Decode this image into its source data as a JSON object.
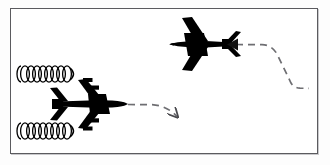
{
  "figure": {
    "domain_label": "wake-turbulence-diagram",
    "background_color": "#ffffff",
    "outer_background_color": "#fdfdfd",
    "frame": {
      "border_color": "#5b5b5f",
      "border_width_px": 1,
      "shadow_color": "#c9c9cc",
      "x": 10,
      "y": 8,
      "width": 308,
      "height": 146
    },
    "ink_color": "#000000",
    "path_color": "#6e6e72",
    "caption": "",
    "title": "",
    "labels": []
  },
  "chart_data": {
    "type": "diagram",
    "title": "",
    "elements": [
      {
        "id": "leading-aircraft",
        "name": "large-aircraft",
        "kind": "aircraft-silhouette",
        "heading": "right",
        "engine_count": 4,
        "center_x": 88,
        "center_y": 104,
        "length_px": 78,
        "wingspan_px": 56,
        "fill": "#000000"
      },
      {
        "id": "following-aircraft",
        "name": "small-aircraft",
        "kind": "aircraft-silhouette",
        "heading": "left",
        "engine_count": 2,
        "center_x": 196,
        "center_y": 44,
        "length_px": 66,
        "wingspan_px": 48,
        "fill": "#000000"
      },
      {
        "id": "vortex-upper",
        "name": "wingtip-vortex-upper",
        "kind": "vortex-spiral",
        "loops": 9,
        "start_x": 18,
        "end_x": 74,
        "center_y": 74,
        "loop_width_px": 7,
        "loop_height_px": 16,
        "stroke": "#000000"
      },
      {
        "id": "vortex-lower",
        "name": "wingtip-vortex-lower",
        "kind": "vortex-spiral",
        "loops": 9,
        "start_x": 18,
        "end_x": 74,
        "center_y": 131,
        "loop_width_px": 7,
        "loop_height_px": 16,
        "stroke": "#000000"
      },
      {
        "id": "path-leading",
        "name": "leading-aircraft-flight-path",
        "kind": "dashed-arrow",
        "direction": "right-descending",
        "has_arrowhead": true,
        "arrowhead_at": "end",
        "stroke": "#6e6e72",
        "dash_pattern": "7 5",
        "points": [
          [
            127,
            105
          ],
          [
            152,
            105
          ],
          [
            168,
            109
          ],
          [
            178,
            117
          ]
        ]
      },
      {
        "id": "path-following",
        "name": "following-aircraft-flight-path",
        "kind": "dashed-arrow",
        "direction": "left",
        "has_arrowhead": true,
        "arrowhead_at": "end",
        "stroke": "#6e6e72",
        "dash_pattern": "7 5",
        "points": [
          [
            302,
            88
          ],
          [
            293,
            88
          ],
          [
            280,
            80
          ],
          [
            270,
            57
          ],
          [
            262,
            48
          ],
          [
            230,
            45
          ]
        ]
      }
    ]
  }
}
